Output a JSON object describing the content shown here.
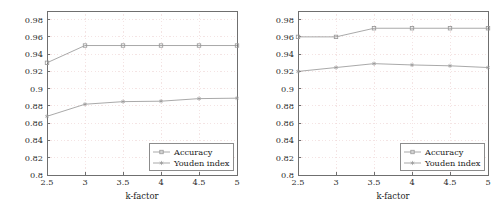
{
  "figure": {
    "background_color": "#ffffff",
    "panel_count": 2,
    "axis_color": "#6f6f6f",
    "grid_color": "#f0d8d8",
    "series_colors": {
      "accuracy": "#9a9a9a",
      "youden_index": "#9a9a9a"
    }
  },
  "chart_data": [
    {
      "type": "line",
      "title": "",
      "xlabel": "k-factor",
      "ylabel": "",
      "x": [
        2.5,
        3,
        3.5,
        4,
        4.5,
        5
      ],
      "xticklabels": [
        "2.5",
        "3",
        "3.5",
        "4",
        "4.5",
        "5"
      ],
      "xlim": [
        2.5,
        5
      ],
      "ylim": [
        0.8,
        0.99
      ],
      "yticks": [
        0.8,
        0.82,
        0.84,
        0.86,
        0.88,
        0.9,
        0.92,
        0.94,
        0.96,
        0.98
      ],
      "yticklabels": [
        "0.8",
        "0.82",
        "0.84",
        "0.86",
        "0.88",
        "0.9",
        "0.92",
        "0.94",
        "0.96",
        "0.98"
      ],
      "grid": true,
      "legend_position": "lower right",
      "series": [
        {
          "name": "Accuracy",
          "marker": "square",
          "values": [
            0.93,
            0.95,
            0.95,
            0.95,
            0.95,
            0.95
          ]
        },
        {
          "name": "Youden index",
          "marker": "star",
          "values": [
            0.868,
            0.882,
            0.885,
            0.8855,
            0.8885,
            0.889
          ]
        }
      ]
    },
    {
      "type": "line",
      "title": "",
      "xlabel": "k-factor",
      "ylabel": "",
      "x": [
        2.5,
        3,
        3.5,
        4,
        4.5,
        5
      ],
      "xticklabels": [
        "2.5",
        "3",
        "3.5",
        "4",
        "4.5",
        "5"
      ],
      "xlim": [
        2.5,
        5
      ],
      "ylim": [
        0.8,
        0.99
      ],
      "yticks": [
        0.8,
        0.82,
        0.84,
        0.86,
        0.88,
        0.9,
        0.92,
        0.94,
        0.96,
        0.98
      ],
      "yticklabels": [
        "0.8",
        "0.82",
        "0.84",
        "0.86",
        "0.88",
        "0.9",
        "0.92",
        "0.94",
        "0.96",
        "0.98"
      ],
      "grid": true,
      "legend_position": "lower right",
      "series": [
        {
          "name": "Accuracy",
          "marker": "square",
          "values": [
            0.96,
            0.96,
            0.97,
            0.97,
            0.97,
            0.97
          ]
        },
        {
          "name": "Youden index",
          "marker": "star",
          "values": [
            0.92,
            0.9245,
            0.929,
            0.9275,
            0.9265,
            0.9245
          ]
        }
      ]
    }
  ]
}
